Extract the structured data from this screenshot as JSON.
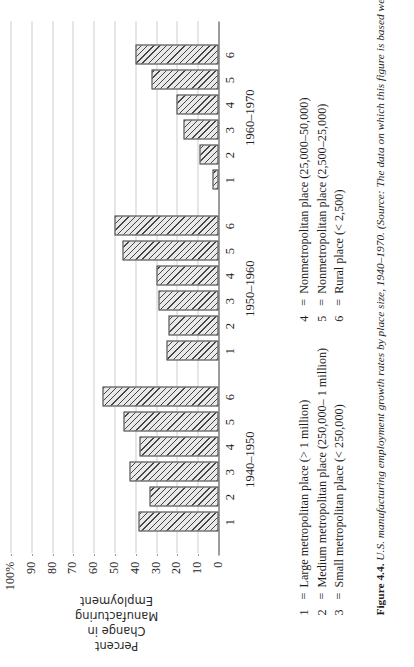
{
  "figure": {
    "number_label": "Figure 4.4.",
    "caption_text": "U.S. manufacturing employment growth rates by place size, 1940–1970. (Source: The data on which this figure is based we"
  },
  "axis": {
    "y_title_lines": [
      "Percent",
      "Change in",
      "Manufacturing",
      "Employment"
    ],
    "y_ticks": [
      "100%",
      "90",
      "80",
      "70",
      "60",
      "50",
      "40",
      "30",
      "20",
      "10",
      "0"
    ]
  },
  "legend": {
    "left_column": [
      {
        "num": "1",
        "eq": "=",
        "text": "Large metropolitan place (> 1 million)"
      },
      {
        "num": "2",
        "eq": "=",
        "text": "Medium metropolitan place (250,000– 1 million)"
      },
      {
        "num": "3",
        "eq": "=",
        "text": "Small metropolitan place (< 250,000)"
      }
    ],
    "right_column": [
      {
        "num": "4",
        "eq": "=",
        "text": "Nonmetropolitan place (25,000–50,000)"
      },
      {
        "num": "5",
        "eq": "=",
        "text": "Nonmetropolitan place (2,500–25,000)"
      },
      {
        "num": "6",
        "eq": "=",
        "text": "Rural place (< 2,500)"
      }
    ]
  },
  "chart_data": {
    "type": "bar",
    "title": "U.S. manufacturing employment growth rates by place size, 1940–1970",
    "xlabel": "",
    "ylabel": "Percent Change in Manufacturing Employment",
    "ylim": [
      0,
      100
    ],
    "ytick_values": [
      0,
      10,
      20,
      30,
      40,
      50,
      60,
      70,
      80,
      90,
      100
    ],
    "grid": true,
    "legend_position": "below",
    "categories": [
      "1",
      "2",
      "3",
      "4",
      "5",
      "6"
    ],
    "category_meaning": [
      "Large metropolitan place (> 1 million)",
      "Medium metropolitan place (250,000– 1 million)",
      "Small metropolitan place (< 250,000)",
      "Nonmetropolitan place (25,000–50,000)",
      "Nonmetropolitan place (2,500–25,000)",
      "Rural place (< 2,500)"
    ],
    "series": [
      {
        "name": "1940–1950",
        "values": [
          38.5,
          33,
          43,
          38,
          45.5,
          56
        ]
      },
      {
        "name": "1950–1960",
        "values": [
          25,
          24,
          29,
          30,
          46,
          50
        ]
      },
      {
        "name": "1960–1970",
        "values": [
          3,
          9,
          17,
          20,
          32,
          40
        ]
      }
    ]
  }
}
